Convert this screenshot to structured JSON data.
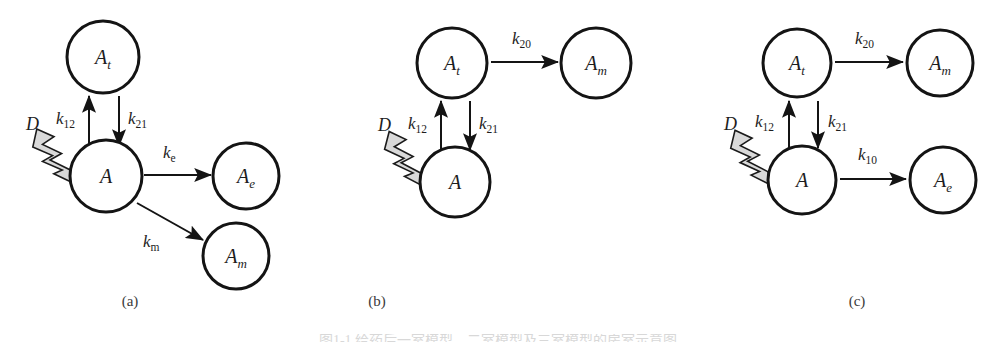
{
  "figure": {
    "type": "scientific-diagram",
    "background_color": "#ffffff",
    "stroke_color": "#141414",
    "bolt_fill_color": "#d9d9d9",
    "bottom_caption": "图1-1  给药后一室模型、二室模型及三室模型的房室示意图"
  },
  "panels": [
    {
      "id": "a",
      "caption": "(a)",
      "caption_x": 130,
      "caption_y": 306,
      "nodes": [
        {
          "name": "At",
          "base": "A",
          "sub": "t",
          "cx": 103,
          "cy": 57,
          "r": 36
        },
        {
          "name": "A",
          "base": "A",
          "sub": "",
          "cx": 106,
          "cy": 176,
          "r": 36
        },
        {
          "name": "Ae",
          "base": "A",
          "sub": "e",
          "cx": 246,
          "cy": 176,
          "r": 33
        },
        {
          "name": "Am",
          "base": "A",
          "sub": "m",
          "cx": 236,
          "cy": 256,
          "r": 33
        }
      ],
      "dose": {
        "label": "D",
        "x": 26,
        "y": 130
      },
      "bolt": {
        "x1": 28,
        "y1": 140,
        "x2": 92,
        "y2": 192
      },
      "arrows": [
        {
          "from": "A",
          "to": "At",
          "label_base": "k",
          "label_sub": "12",
          "x1": 89,
          "y1": 146,
          "x2": 89,
          "y2": 96,
          "lx": 56,
          "ly": 124
        },
        {
          "from": "At",
          "to": "A",
          "label_base": "k",
          "label_sub": "21",
          "x1": 119,
          "y1": 96,
          "x2": 119,
          "y2": 146,
          "lx": 128,
          "ly": 124
        },
        {
          "from": "A",
          "to": "Ae",
          "label_base": "k",
          "label_sub": "e",
          "x1": 144,
          "y1": 175,
          "x2": 211,
          "y2": 175,
          "lx": 163,
          "ly": 158
        },
        {
          "from": "A",
          "to": "Am",
          "label_base": "k",
          "label_sub": "m",
          "x1": 137,
          "y1": 203,
          "x2": 203,
          "y2": 240,
          "lx": 143,
          "ly": 247
        }
      ]
    },
    {
      "id": "b",
      "caption": "(b)",
      "caption_x": 377,
      "caption_y": 306,
      "nodes": [
        {
          "name": "At",
          "base": "A",
          "sub": "t",
          "cx": 452,
          "cy": 63,
          "r": 35
        },
        {
          "name": "Am",
          "base": "A",
          "sub": "m",
          "cx": 596,
          "cy": 63,
          "r": 35
        },
        {
          "name": "A",
          "base": "A",
          "sub": "",
          "cx": 455,
          "cy": 182,
          "r": 35
        }
      ],
      "dose": {
        "label": "D",
        "x": 378,
        "y": 131
      },
      "bolt": {
        "x1": 380,
        "y1": 142,
        "x2": 442,
        "y2": 196
      },
      "arrows": [
        {
          "from": "At",
          "to": "Am",
          "label_base": "k",
          "label_sub": "20",
          "x1": 491,
          "y1": 62,
          "x2": 558,
          "y2": 62,
          "lx": 512,
          "ly": 44
        },
        {
          "from": "A",
          "to": "At",
          "label_base": "k",
          "label_sub": "12",
          "x1": 441,
          "y1": 150,
          "x2": 441,
          "y2": 101,
          "lx": 408,
          "ly": 129
        },
        {
          "from": "At",
          "to": "A",
          "label_base": "k",
          "label_sub": "21",
          "x1": 470,
          "y1": 101,
          "x2": 470,
          "y2": 150,
          "lx": 479,
          "ly": 129
        }
      ]
    },
    {
      "id": "c",
      "caption": "(c)",
      "caption_x": 857,
      "caption_y": 306,
      "nodes": [
        {
          "name": "At",
          "base": "A",
          "sub": "t",
          "cx": 797,
          "cy": 63,
          "r": 34
        },
        {
          "name": "Am",
          "base": "A",
          "sub": "m",
          "cx": 940,
          "cy": 63,
          "r": 33
        },
        {
          "name": "A",
          "base": "A",
          "sub": "",
          "cx": 802,
          "cy": 180,
          "r": 34
        },
        {
          "name": "Ae",
          "base": "A",
          "sub": "e",
          "cx": 943,
          "cy": 180,
          "r": 33
        }
      ],
      "dose": {
        "label": "D",
        "x": 724,
        "y": 130
      },
      "bolt": {
        "x1": 726,
        "y1": 141,
        "x2": 789,
        "y2": 194
      },
      "arrows": [
        {
          "from": "At",
          "to": "Am",
          "label_base": "k",
          "label_sub": "20",
          "x1": 835,
          "y1": 62,
          "x2": 903,
          "y2": 62,
          "lx": 855,
          "ly": 44
        },
        {
          "from": "A",
          "to": "At",
          "label_base": "k",
          "label_sub": "12",
          "x1": 789,
          "y1": 148,
          "x2": 789,
          "y2": 101,
          "lx": 755,
          "ly": 127
        },
        {
          "from": "At",
          "to": "A",
          "label_base": "k",
          "label_sub": "21",
          "x1": 818,
          "y1": 101,
          "x2": 818,
          "y2": 148,
          "lx": 828,
          "ly": 127
        },
        {
          "from": "A",
          "to": "Ae",
          "label_base": "k",
          "label_sub": "10",
          "x1": 840,
          "y1": 179,
          "x2": 906,
          "y2": 179,
          "lx": 858,
          "ly": 160
        }
      ]
    }
  ]
}
